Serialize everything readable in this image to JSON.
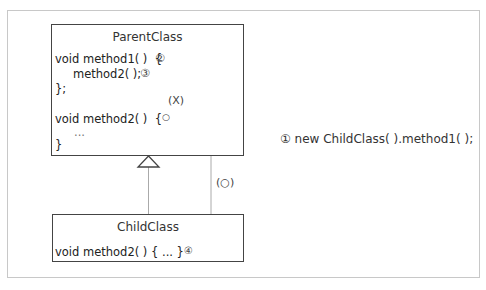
{
  "parent_class": {
    "title": "ParentClass",
    "lines": {
      "method1_decl": "void method1( )  {",
      "method1_call": "method2( );",
      "method1_close": "};",
      "method2_decl": "void method2( )  {",
      "method2_body": "...",
      "method2_close": "}"
    },
    "markers": {
      "step2": "②",
      "step3": "③",
      "override_target": "○"
    }
  },
  "child_class": {
    "title": "ChildClass",
    "lines": {
      "method2_decl": "void method2( ) { ... }"
    },
    "markers": {
      "step4": "④"
    }
  },
  "path_labels": {
    "not_called": "(X)",
    "called": "(○)"
  },
  "callout": {
    "text": "① new ChildClass( ).method1( );"
  },
  "colors": {
    "box_border": "#444444",
    "frame_border": "#c8c8c8",
    "arrow_line": "#aaaaaa"
  }
}
